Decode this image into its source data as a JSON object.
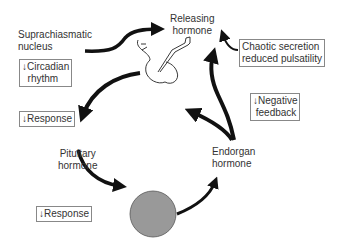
{
  "diagram": {
    "nodes": {
      "scn": "Suprachiasmatic\nnucleus",
      "releasing": "Releasing\nhormone",
      "pituitary": "Pituitary\nhormone",
      "endorgan": "Endorgan\nhormone"
    },
    "annotations": {
      "circadian": "↓Circadian\n  rhythm",
      "chaotic": "Chaotic secretion\nreduced pulsatility",
      "response_top": "↓Response",
      "negative_feedback": "↓Negative\n feedback",
      "response_bottom": "↓Response"
    },
    "colors": {
      "arrow": "#111111",
      "gland": "#999999",
      "text": "#333333"
    }
  }
}
